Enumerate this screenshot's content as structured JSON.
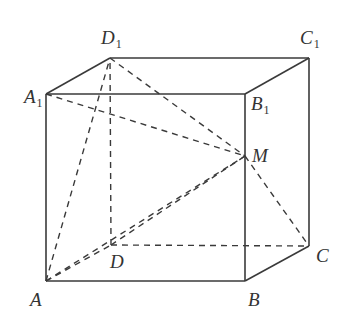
{
  "diagram": {
    "type": "cube-geometry",
    "stroke_color": "#3a3a3a",
    "vertices": [
      {
        "id": "A",
        "label": "A",
        "sub": "",
        "x": 46,
        "y": 281,
        "lx": 30,
        "ly": 306
      },
      {
        "id": "B",
        "label": "B",
        "sub": "",
        "x": 245,
        "y": 281,
        "lx": 248,
        "ly": 306
      },
      {
        "id": "C",
        "label": "C",
        "sub": "",
        "x": 309,
        "y": 246,
        "lx": 316,
        "ly": 262
      },
      {
        "id": "D",
        "label": "D",
        "sub": "",
        "x": 111,
        "y": 245,
        "lx": 110,
        "ly": 268
      },
      {
        "id": "A1",
        "label": "A",
        "sub": "1",
        "x": 46,
        "y": 94,
        "lx": 24,
        "ly": 103
      },
      {
        "id": "B1",
        "label": "B",
        "sub": "1",
        "x": 245,
        "y": 94,
        "lx": 251,
        "ly": 110
      },
      {
        "id": "C1",
        "label": "C",
        "sub": "1",
        "x": 309,
        "y": 58,
        "lx": 300,
        "ly": 44
      },
      {
        "id": "D1",
        "label": "D",
        "sub": "1",
        "x": 110,
        "y": 58,
        "lx": 101,
        "ly": 44
      },
      {
        "id": "M",
        "label": "M",
        "sub": "",
        "x": 245,
        "y": 156,
        "lx": 252,
        "ly": 162
      }
    ],
    "solid_edges": [
      [
        "A",
        "B"
      ],
      [
        "B",
        "C"
      ],
      [
        "A",
        "A1"
      ],
      [
        "B",
        "B1"
      ],
      [
        "C",
        "C1"
      ],
      [
        "A1",
        "B1"
      ],
      [
        "B1",
        "C1"
      ],
      [
        "C1",
        "D1"
      ],
      [
        "D1",
        "A1"
      ]
    ],
    "dashed_edges": [
      [
        "A",
        "D"
      ],
      [
        "D",
        "C"
      ],
      [
        "D",
        "D1"
      ],
      [
        "A",
        "D1"
      ],
      [
        "D1",
        "M"
      ],
      [
        "A1",
        "M"
      ],
      [
        "A",
        "M"
      ],
      [
        "D",
        "M"
      ],
      [
        "M",
        "C"
      ]
    ]
  }
}
